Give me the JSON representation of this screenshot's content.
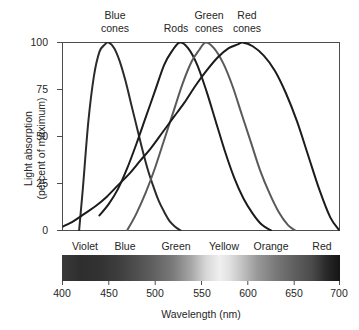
{
  "chart_data": {
    "type": "line",
    "title": "",
    "xlabel": "Wavelength (nm)",
    "ylabel": "Light absorption\n(percent of maximum)",
    "ylabel_line1": "Light absorption",
    "ylabel_line2": "(percent of maximum)",
    "xlim": [
      400,
      700
    ],
    "ylim": [
      0,
      100
    ],
    "grid": false,
    "legend_position": "above-curves-inline",
    "xticks": [
      400,
      450,
      500,
      550,
      600,
      650,
      700
    ],
    "yticks": [
      0,
      25,
      50,
      75,
      100
    ],
    "series": [
      {
        "name": "Blue cones",
        "label_x": 450,
        "peak_x": 450,
        "peak_y": 100,
        "color": "#2b2b2b",
        "x": [
          418,
          422,
          428,
          434,
          440,
          446,
          450,
          456,
          462,
          468,
          474,
          480,
          486,
          492,
          498,
          504,
          510,
          516,
          522,
          528
        ],
        "values": [
          0,
          22,
          58,
          82,
          95,
          99,
          100,
          97,
          90,
          80,
          68,
          56,
          44,
          33,
          24,
          16,
          10,
          5,
          2,
          0
        ]
      },
      {
        "name": "Rods",
        "label_x": 527,
        "peak_x": 527,
        "peak_y": 100,
        "color": "#1c1c1c",
        "x": [
          440,
          450,
          460,
          470,
          480,
          490,
          500,
          510,
          518,
          527,
          536,
          546,
          556,
          566,
          576,
          586,
          596,
          606,
          616,
          626
        ],
        "values": [
          8,
          14,
          22,
          33,
          46,
          60,
          74,
          88,
          95,
          100,
          97,
          88,
          74,
          58,
          42,
          28,
          17,
          9,
          3,
          0
        ]
      },
      {
        "name": "Green cones",
        "label_x": 555,
        "peak_x": 555,
        "peak_y": 100,
        "color": "#5a5a5a",
        "x": [
          470,
          480,
          490,
          500,
          510,
          520,
          530,
          540,
          548,
          555,
          564,
          574,
          584,
          594,
          604,
          614,
          624,
          634,
          644,
          652
        ],
        "values": [
          0,
          9,
          20,
          33,
          48,
          63,
          78,
          90,
          96,
          100,
          97,
          89,
          77,
          62,
          47,
          32,
          20,
          10,
          3,
          0
        ]
      },
      {
        "name": "Red cones",
        "label_x": 595,
        "peak_x": 595,
        "peak_y": 100,
        "color": "#1c1c1c",
        "x": [
          400,
          412,
          424,
          436,
          448,
          460,
          472,
          484,
          496,
          508,
          520,
          532,
          544,
          556,
          568,
          580,
          590,
          595,
          606,
          618,
          630,
          642,
          654,
          666,
          678,
          690,
          700
        ],
        "values": [
          2,
          5,
          9,
          13,
          18,
          24,
          30,
          37,
          44,
          52,
          60,
          68,
          77,
          85,
          92,
          97,
          99,
          100,
          98,
          93,
          85,
          73,
          58,
          40,
          22,
          7,
          0
        ]
      }
    ],
    "spectrum_bands": [
      {
        "label": "Violet",
        "center_nm": 425
      },
      {
        "label": "Blue",
        "center_nm": 468
      },
      {
        "label": "Green",
        "center_nm": 523
      },
      {
        "label": "Yellow",
        "center_nm": 574
      },
      {
        "label": "Orange",
        "center_nm": 625
      },
      {
        "label": "Red",
        "center_nm": 680
      }
    ]
  }
}
